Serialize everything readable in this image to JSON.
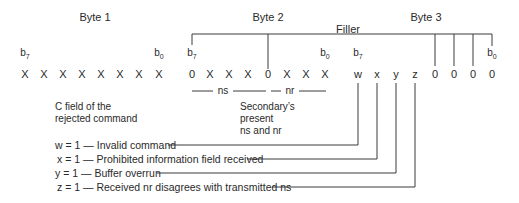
{
  "bytes": [
    {
      "title": "Byte 1",
      "msb_label": "b",
      "msb_sub": "7",
      "lsb_label": "b",
      "lsb_sub": "0",
      "bits": [
        "X",
        "X",
        "X",
        "X",
        "X",
        "X",
        "X",
        "X"
      ]
    },
    {
      "title": "Byte 2",
      "msb_label": "b",
      "msb_sub": "7",
      "lsb_label": "b",
      "lsb_sub": "0",
      "bits": [
        "0",
        "X",
        "X",
        "X",
        "0",
        "X",
        "X",
        "X"
      ]
    },
    {
      "title": "Byte 3",
      "msb_label": "b",
      "msb_sub": "7",
      "lsb_label": "b",
      "lsb_sub": "0",
      "bits": [
        "w",
        "x",
        "y",
        "z",
        "0",
        "0",
        "0",
        "0"
      ]
    }
  ],
  "filler_label": "Filler",
  "ns_label": "ns",
  "nr_label": "nr",
  "notes": {
    "byte1": [
      "C field of the",
      "rejected command"
    ],
    "byte2": [
      "Secondary’s",
      "present",
      "ns and nr"
    ]
  },
  "legend": [
    {
      "text": "w = 1 — Invalid command"
    },
    {
      "text": "x = 1 — Prohibited information field received"
    },
    {
      "text": "y = 1 — Buffer overrun"
    },
    {
      "text": "z = 1 — Received nr disagrees with transmitted ns"
    }
  ]
}
